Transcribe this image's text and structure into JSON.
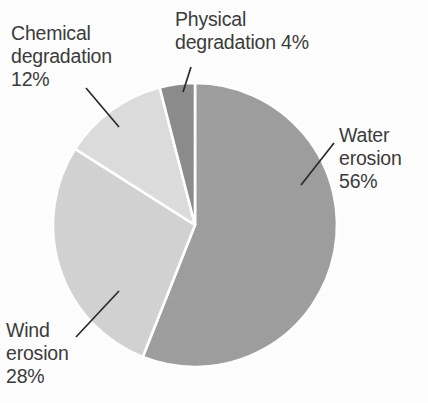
{
  "figure": {
    "background_color": "#fdfdfd",
    "text_color": "#3b3b3b",
    "divider_color": "#ffffff",
    "leader_line_color": "#2b2b2b"
  },
  "chart_data": {
    "type": "pie",
    "title": "",
    "unit": "%",
    "start_angle_deg": 0,
    "direction": "clockwise",
    "grid": false,
    "legend_position": "none (direct labels with leader lines)",
    "categories": [
      "Water erosion",
      "Wind erosion",
      "Chemical degradation",
      "Physical degradation"
    ],
    "values": [
      56,
      28,
      12,
      4
    ],
    "colors": [
      "#9e9e9e",
      "#d2d2d2",
      "#dcdcdc",
      "#8c8c8c"
    ],
    "slices": [
      {
        "label": "Water erosion",
        "value": 56,
        "value_text": "56%",
        "color": "#9e9e9e",
        "start_angle_deg": 0,
        "end_angle_deg": 201.6
      },
      {
        "label": "Wind erosion",
        "value": 28,
        "value_text": "28%",
        "color": "#d2d2d2",
        "start_angle_deg": 201.6,
        "end_angle_deg": 302.4
      },
      {
        "label": "Chemical degradation",
        "value": 12,
        "value_text": "12%",
        "color": "#dcdcdc",
        "start_angle_deg": 302.4,
        "end_angle_deg": 345.6
      },
      {
        "label": "Physical degradation",
        "value": 4,
        "value_text": "4%",
        "color": "#8c8c8c",
        "start_angle_deg": 345.6,
        "end_angle_deg": 360
      }
    ]
  },
  "labels": {
    "chemical": {
      "line1": "Chemical",
      "line2": "degradation",
      "line3": "12%"
    },
    "physical": {
      "line1": "Physical",
      "line2": "degradation 4%"
    },
    "water": {
      "line1": "Water",
      "line2": "erosion",
      "line3": "56%"
    },
    "wind": {
      "line1": "Wind",
      "line2": "erosion",
      "line3": "28%"
    }
  }
}
